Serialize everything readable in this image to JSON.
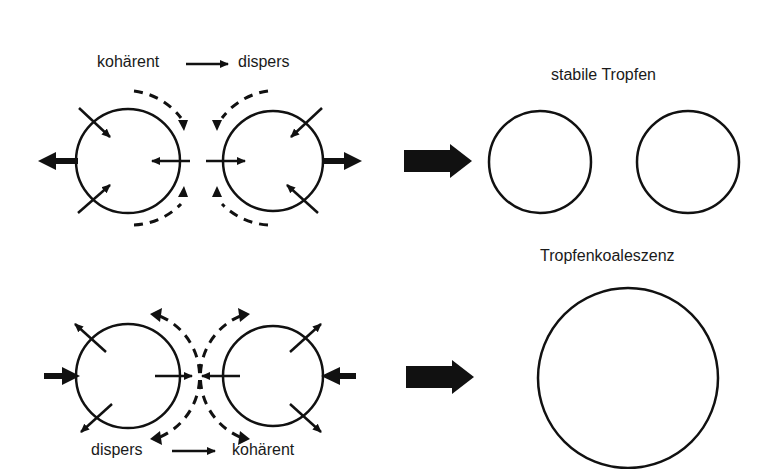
{
  "colors": {
    "ink": "#111111",
    "background": "#ffffff",
    "text": "#1a1a1a"
  },
  "top_row": {
    "transition_from": "kohärent",
    "transition_to": "dispers",
    "result_label": "stabile Tropfen"
  },
  "bottom_row": {
    "transition_from": "dispers",
    "transition_to": "kohärent",
    "result_label": "Tropfenkoaleszenz"
  },
  "icons": {
    "transition_arrow": "right-arrow-icon",
    "result_arrow": "thick-right-arrow-icon"
  }
}
